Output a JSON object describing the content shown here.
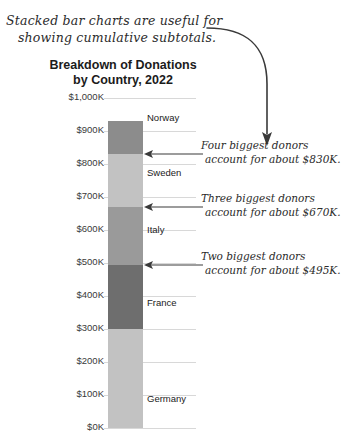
{
  "note": {
    "line1": "Stacked bar charts are useful for",
    "line2": "showing cumulative subtotals."
  },
  "chart_data": {
    "type": "bar",
    "stacked": true,
    "title": "Breakdown of Donations by Country, 2022",
    "title_line1": "Breakdown of Donations",
    "title_line2": "by Country, 2022",
    "xlabel": "",
    "ylabel": "",
    "ylim": [
      0,
      1000
    ],
    "grid": true,
    "legend": "none (labels beside segments)",
    "categories": [
      "2022"
    ],
    "tick_labels": [
      "$1,000K",
      "$900K",
      "$800K",
      "$700K",
      "$600K",
      "$500K",
      "$400K",
      "$300K",
      "$200K",
      "$100K",
      "$0K"
    ],
    "tick_values": [
      1000,
      900,
      800,
      700,
      600,
      500,
      400,
      300,
      200,
      100,
      0
    ],
    "series": [
      {
        "name": "Norway",
        "value": 100,
        "cumulative_top": 930,
        "cumulative_bottom": 830,
        "color": "#8c8c8c"
      },
      {
        "name": "Sweden",
        "value": 160,
        "cumulative_top": 830,
        "cumulative_bottom": 670,
        "color": "#c2c2c2"
      },
      {
        "name": "Italy",
        "value": 175,
        "cumulative_top": 670,
        "cumulative_bottom": 495,
        "color": "#9a9a9a"
      },
      {
        "name": "France",
        "value": 195,
        "cumulative_top": 495,
        "cumulative_bottom": 300,
        "color": "#6e6e6e"
      },
      {
        "name": "Germany",
        "value": 300,
        "cumulative_top": 300,
        "cumulative_bottom": 0,
        "color": "#c2c2c2"
      }
    ],
    "total": 930,
    "annotations": [
      {
        "line1": "Four biggest donors",
        "line2": "account for about $830K.",
        "points_to_value": 830
      },
      {
        "line1": "Three biggest donors",
        "line2": "account for about $670K.",
        "points_to_value": 670
      },
      {
        "line1": "Two biggest donors",
        "line2": "account for about $495K.",
        "points_to_value": 495
      }
    ]
  },
  "colors": {
    "gridline": "#d8d8d8",
    "text": "#222222",
    "ink": "#2b2b2b"
  }
}
